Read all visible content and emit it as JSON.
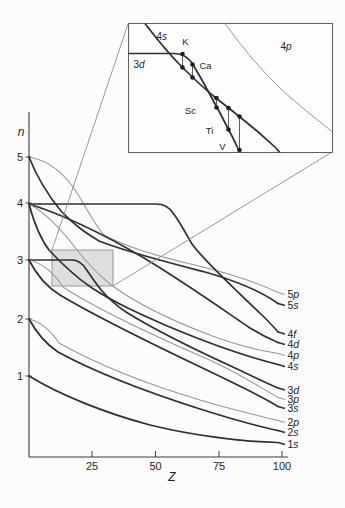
{
  "figure": {
    "bg": "#fcfcfc",
    "ink": "#2f2f2f",
    "thin_ink": "#979797",
    "axis_color": "#3a3a3a",
    "connector_color": "#8c8c8c",
    "magnifier_fill": "#c7c7c7",
    "axes": {
      "y_line": {
        "x1": 29,
        "y1": 112,
        "x2": 29,
        "y2": 457
      },
      "x_line": {
        "x1": 29,
        "y1": 457,
        "x2": 288,
        "y2": 457
      },
      "y_label": "n",
      "x_label": "Z",
      "y_label_pos": {
        "x": 21,
        "y": 136
      },
      "x_label_pos": {
        "x": 172,
        "y": 481
      },
      "y_ticks": [
        {
          "v": "5",
          "y": 157
        },
        {
          "v": "4",
          "y": 203
        },
        {
          "v": "3",
          "y": 260
        },
        {
          "v": "2",
          "y": 319
        },
        {
          "v": "1",
          "y": 376
        }
      ],
      "x_ticks": [
        {
          "v": "25",
          "x": 92
        },
        {
          "v": "50",
          "x": 155.5
        },
        {
          "v": "75",
          "x": 219
        },
        {
          "v": "100",
          "x": 282
        }
      ]
    },
    "curves": [
      {
        "id": "5p",
        "num": "5",
        "letter": "p",
        "thick": false,
        "ly": 294.5,
        "d": "M29,157 C47,160 65,173 79,196 C87,209 95,225 104,235 C128,248 160,257 195,265 C232,274 258,283 278,292.5"
      },
      {
        "id": "5s",
        "num": "5",
        "letter": "s",
        "thick": true,
        "ly": 305.5,
        "d": "M29,157 C36,175 47,194 61,211 C76,227 88,234 99,241 C130,253 170,263 205,272 C240,282 262,292 278,303.5"
      },
      {
        "id": "4f",
        "num": "4",
        "letter": "f",
        "thick": true,
        "ly": 334,
        "d": "M29,204 L156,204 C163,204 169,207 173,213 C180,222 186,234 192,244 C205,262 238,292 262,315 C269,322 274,327 278,332"
      },
      {
        "id": "4d",
        "num": "4",
        "letter": "d",
        "thick": true,
        "ly": 344.5,
        "d": "M29,204 C64,215 105,235 144,258 C184,282 222,309 250,328 C263,336 272,340 278,342.5"
      },
      {
        "id": "4p",
        "num": "4",
        "letter": "p",
        "thick": false,
        "ly": 355.5,
        "d": "M29,204 C46,213 62,230 77,250 C88,264 99,275 110,284 C135,303 175,322 215,337 C240,346 262,351 278,353.5"
      },
      {
        "id": "4s",
        "num": "4",
        "letter": "s",
        "thick": true,
        "ly": 366.5,
        "d": "M29,204 C34,223 40,238 49,250 C62,264 77,278 92,288 C115,303 140,314 165,325 C205,342 248,357 278,364.5"
      },
      {
        "id": "3d",
        "num": "3",
        "letter": "d",
        "thick": true,
        "ly": 390,
        "d": "M29,260 L72,260 C78,260 82,263 86,269 C91,276 96,284 102,291 C109,299 117,306 126,312 C155,330 200,352 235,368 C252,376 266,383 278,388"
      },
      {
        "id": "3p",
        "num": "3",
        "letter": "p",
        "thick": false,
        "ly": 399.5,
        "d": "M29,260 C42,263 54,273 63,287 C95,308 150,334 205,358 C233,370 260,387 278,397.5"
      },
      {
        "id": "3s",
        "num": "3",
        "letter": "s",
        "thick": true,
        "ly": 408.5,
        "d": "M29,260 C36,274 47,287 60,295 C105,322 165,350 215,374 C242,387 263,397 278,406.5"
      },
      {
        "id": "2p",
        "num": "2",
        "letter": "p",
        "thick": false,
        "ly": 422.5,
        "d": "M29,319 C41,322 51,331 59,343 C100,366 150,385 200,400 C233,410 260,416 278,420.5"
      },
      {
        "id": "2s",
        "num": "2",
        "letter": "s",
        "thick": true,
        "ly": 432.5,
        "d": "M29,319 C36,332 46,344 58,352 C100,375 150,393 200,409 C235,420 261,427 278,430.5"
      },
      {
        "id": "1s",
        "num": "1",
        "letter": "s",
        "thick": true,
        "ly": 444.5,
        "d": "M29,376 C60,395 105,413 150,425 C195,436 245,442 278,442.5"
      }
    ],
    "magnifier": {
      "rect": {
        "x": 52,
        "y": 250,
        "w": 61,
        "h": 36
      },
      "connectors": [
        {
          "x1": 128,
          "y1": 24,
          "x2": 52,
          "y2": 250
        },
        {
          "x1": 332,
          "y1": 152,
          "x2": 113,
          "y2": 286
        }
      ]
    },
    "inset": {
      "box": {
        "x": 128.5,
        "y": 23.5,
        "w": 204,
        "h": 129
      },
      "curves": [
        {
          "id": "inset-4s",
          "thick": true,
          "d": "M15,-2 Q36,26 54,44 Q72,62 88,75 Q101,85 112,94 Q131,109 147,124 L153,131"
        },
        {
          "id": "inset-3d",
          "thick": true,
          "d": "M-2,30 L46,30 Q58,30 65,42 Q74,57 82,72 Q92,90 100,106 Q105,115 109,124 L112,131"
        },
        {
          "id": "inset-4p",
          "thick": false,
          "d": "M95,-2 Q125,40 155,68 Q180,90 206,110"
        }
      ],
      "orbital_labels": [
        {
          "id": "4s",
          "num": "4",
          "letter": "s",
          "x": 36,
          "y": 13
        },
        {
          "id": "3d",
          "num": "3",
          "letter": "d",
          "x": 13,
          "y": 41
        },
        {
          "id": "4p",
          "num": "4",
          "letter": "p",
          "x": 160,
          "y": 23
        }
      ],
      "element_pairs": [
        {
          "symbol": "K",
          "x": 54,
          "y_top": 30.5,
          "y_bot": 44,
          "lx": 57,
          "ly_label": 21
        },
        {
          "symbol": "Ca",
          "x": 64,
          "y_top": 41,
          "y_bot": 54,
          "lx": 77,
          "ly_label": 45
        },
        {
          "symbol": "Sc",
          "x": 88,
          "y_top": 74.5,
          "y_bot": 84,
          "lx": 62,
          "ly_label": 90
        },
        {
          "symbol": "Ti",
          "x": 100,
          "y_top": 84.5,
          "y_bot": 106,
          "lx": 81,
          "ly_label": 110
        },
        {
          "symbol": "V",
          "x": 111,
          "y_top": 93,
          "y_bot": 126.5,
          "lx": 94,
          "ly_label": 126
        }
      ]
    }
  },
  "chart_data": {
    "type": "line",
    "xlabel": "Z",
    "ylabel": "n",
    "xlim": [
      0,
      100
    ],
    "x_ticks": [
      25,
      50,
      75,
      100
    ],
    "y_ticks": [
      1,
      2,
      3,
      4,
      5
    ],
    "grid": false,
    "legend_position": "labels at right ends of curves",
    "note": "Values below are visually estimated from the drawing; the region below n=1 is unlabeled on the axis. Thick dark curves = s, d, f orbitals; thin light curves = p orbitals.",
    "x_sample_Z": [
      0,
      10,
      20,
      30,
      40,
      50,
      60,
      70,
      80,
      90,
      100
    ],
    "series": [
      {
        "name": "1s",
        "values": [
          1.0,
          0.75,
          0.5,
          0.35,
          0.25,
          0.15,
          0.1,
          0.1,
          0.1,
          0.1,
          0.1
        ]
      },
      {
        "name": "2s",
        "values": [
          2.0,
          1.55,
          1.25,
          1.0,
          0.75,
          0.6,
          0.4,
          0.3,
          0.2,
          0.1,
          0.1
        ]
      },
      {
        "name": "2p",
        "values": [
          2.0,
          1.7,
          1.4,
          1.2,
          0.95,
          0.75,
          0.6,
          0.45,
          0.35,
          0.25,
          0.2
        ]
      },
      {
        "name": "3s",
        "values": [
          3.0,
          2.45,
          2.2,
          1.9,
          1.65,
          1.45,
          1.25,
          1.05,
          0.85,
          0.65,
          0.45
        ]
      },
      {
        "name": "3p",
        "values": [
          3.0,
          2.6,
          2.35,
          2.1,
          1.85,
          1.6,
          1.4,
          1.2,
          1.0,
          0.8,
          0.6
        ]
      },
      {
        "name": "3d",
        "values": [
          3.0,
          3.0,
          3.0,
          2.45,
          2.1,
          1.8,
          1.55,
          1.4,
          1.15,
          0.95,
          0.75
        ]
      },
      {
        "name": "4s",
        "values": [
          4.0,
          3.45,
          3.0,
          2.4,
          2.15,
          1.95,
          1.75,
          1.55,
          1.4,
          1.3,
          1.15
        ]
      },
      {
        "name": "4p",
        "values": [
          4.0,
          3.75,
          3.35,
          2.8,
          2.35,
          2.1,
          1.9,
          1.75,
          1.6,
          1.45,
          1.35
        ]
      },
      {
        "name": "4d",
        "values": [
          4.0,
          3.9,
          3.7,
          3.5,
          3.25,
          3.0,
          2.7,
          2.45,
          2.15,
          1.85,
          1.6
        ]
      },
      {
        "name": "4f",
        "values": [
          4.0,
          4.0,
          4.0,
          4.0,
          4.0,
          4.0,
          3.55,
          3.0,
          2.55,
          2.15,
          1.75
        ]
      },
      {
        "name": "5s",
        "values": [
          5.0,
          4.25,
          3.6,
          3.35,
          3.25,
          3.1,
          2.95,
          2.85,
          2.65,
          2.45,
          2.3
        ]
      },
      {
        "name": "5p",
        "values": [
          5.0,
          4.7,
          4.2,
          3.5,
          3.25,
          3.1,
          3.0,
          2.9,
          2.8,
          2.65,
          2.5
        ]
      }
    ],
    "annotations": {
      "shaded_region": "gray rectangle over Z ≈ 9–33, n ≈ 2.6–3.1 marking the magnified area",
      "inset": {
        "curves_shown": [
          "4s",
          "3d",
          "4p"
        ],
        "elements_marked": [
          "K",
          "Ca",
          "Sc",
          "Ti",
          "V"
        ],
        "description": "Each element has a pair of dots joined by a vertical segment: for K and Ca the 4s point lies below the 3d line; from Sc onward the plunging 3d curve lies below 4s."
      },
      "features": [
        "3d stays flat at n=3 until ~Z=20 then drops steeply",
        "4f stays flat at n=4 until ~Z=55 then drops steeply"
      ]
    }
  }
}
